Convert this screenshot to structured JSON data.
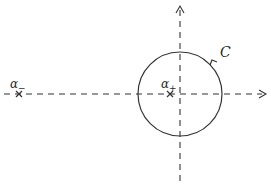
{
  "diagram": {
    "type": "complex-plane contour",
    "colors": {
      "stroke": "#333333",
      "background": "#ffffff"
    },
    "axes": {
      "horizontal": {
        "y": 94,
        "x_start": 4,
        "x_end": 266,
        "style": "dashed",
        "arrow": "right"
      },
      "vertical": {
        "x": 180,
        "y_start": 5,
        "y_end": 183,
        "style": "dashed",
        "arrow": "up"
      }
    },
    "contour": {
      "label": "C",
      "center": [
        180,
        94
      ],
      "radius": 42,
      "orientation": "counterclockwise"
    },
    "points": [
      {
        "name": "alpha-minus",
        "symbol": "α",
        "subscript": "−",
        "x": 19,
        "y": 94
      },
      {
        "name": "alpha-plus",
        "symbol": "α",
        "subscript": "+",
        "x": 170,
        "y": 94
      }
    ]
  }
}
